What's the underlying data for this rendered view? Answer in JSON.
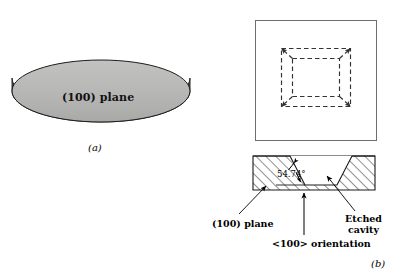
{
  "figure": {
    "background_color": "#ffffff",
    "ink_color": "#000000",
    "panel_a": {
      "caption": "(a)",
      "wafer_label": "(100) plane",
      "wafer_top_face_color": "#b5b5b3",
      "wafer_rim_color": "#4e4e4e",
      "wafer_outline_color": "#1a1a1a"
    },
    "panel_b": {
      "caption": "(b)",
      "top_view": {
        "outline_color": "#6b6b6b",
        "dashed_color": "#3a3a3a",
        "description": "square substrate top view with dashed truncated-pyramid cavity outline"
      },
      "cross_section": {
        "hatch_color": "#2b2b2b",
        "outline_color": "#1a1a1a",
        "description": "hatched silicon block with trapezoidal anisotropically etched cavity"
      },
      "angle_label": "54.74°",
      "plane_label": "(100) plane",
      "orientation_label": "<100> orientation",
      "etched_cavity_label_line1": "Etched",
      "etched_cavity_label_line2": "cavity"
    }
  }
}
